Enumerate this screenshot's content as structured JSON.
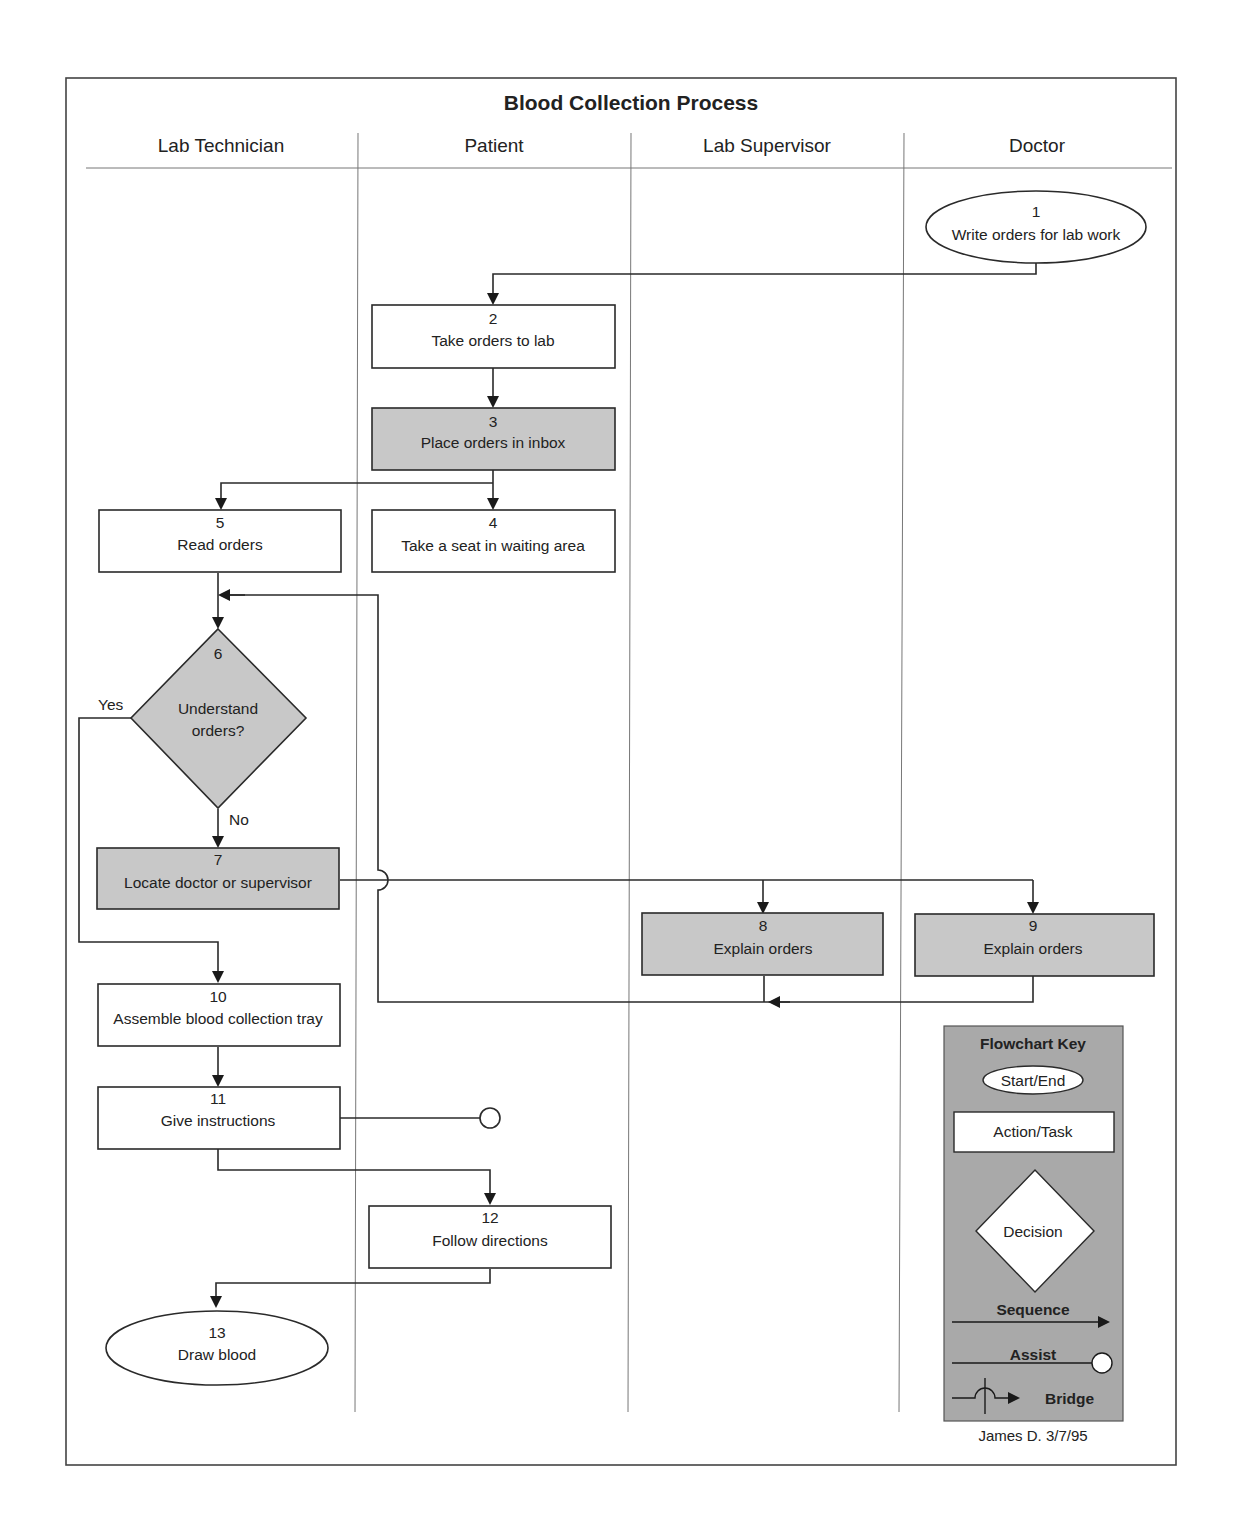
{
  "diagram": {
    "title": "Blood Collection Process",
    "lanes": [
      "Lab Technician",
      "Patient",
      "Lab Supervisor",
      "Doctor"
    ],
    "nodes": [
      {
        "id": "1",
        "label": "Write orders for lab work",
        "shape": "ellipse",
        "lane": "Doctor",
        "fill": "white"
      },
      {
        "id": "2",
        "label": "Take orders to lab",
        "shape": "rect",
        "lane": "Patient",
        "fill": "white"
      },
      {
        "id": "3",
        "label": "Place orders in inbox",
        "shape": "rect",
        "lane": "Patient",
        "fill": "gray"
      },
      {
        "id": "4",
        "label": "Take a seat in waiting area",
        "shape": "rect",
        "lane": "Patient",
        "fill": "white"
      },
      {
        "id": "5",
        "label": "Read orders",
        "shape": "rect",
        "lane": "Lab Technician",
        "fill": "white"
      },
      {
        "id": "6",
        "label": "Understand orders?",
        "label_lines": [
          "Understand",
          "orders?"
        ],
        "shape": "diamond",
        "lane": "Lab Technician",
        "fill": "gray"
      },
      {
        "id": "7",
        "label": "Locate doctor or supervisor",
        "shape": "rect",
        "lane": "Lab Technician",
        "fill": "gray"
      },
      {
        "id": "8",
        "label": "Explain orders",
        "shape": "rect",
        "lane": "Lab Supervisor",
        "fill": "gray"
      },
      {
        "id": "9",
        "label": "Explain orders",
        "shape": "rect",
        "lane": "Doctor",
        "fill": "gray"
      },
      {
        "id": "10",
        "label": "Assemble blood collection tray",
        "shape": "rect",
        "lane": "Lab Technician",
        "fill": "white"
      },
      {
        "id": "11",
        "label": "Give instructions",
        "shape": "rect",
        "lane": "Lab Technician",
        "fill": "white"
      },
      {
        "id": "12",
        "label": "Follow directions",
        "shape": "rect",
        "lane": "Patient",
        "fill": "white"
      },
      {
        "id": "13",
        "label": "Draw blood",
        "shape": "ellipse",
        "lane": "Lab Technician",
        "fill": "white"
      }
    ],
    "edges": [
      {
        "from": "1",
        "to": "2",
        "type": "sequence"
      },
      {
        "from": "2",
        "to": "3",
        "type": "sequence"
      },
      {
        "from": "3",
        "to": "4",
        "type": "sequence"
      },
      {
        "from": "3",
        "to": "5",
        "type": "sequence"
      },
      {
        "from": "5",
        "to": "6",
        "type": "sequence"
      },
      {
        "from": "6",
        "to": "7",
        "type": "sequence",
        "label": "No"
      },
      {
        "from": "6",
        "to": "10",
        "type": "sequence",
        "label": "Yes"
      },
      {
        "from": "7",
        "to": "8",
        "type": "sequence"
      },
      {
        "from": "7",
        "to": "9",
        "type": "sequence"
      },
      {
        "from": "8",
        "to": "6",
        "type": "sequence",
        "bridge": "the vertical return line hops over the horizontal line from 7"
      },
      {
        "from": "9",
        "to": "6",
        "type": "sequence"
      },
      {
        "from": "10",
        "to": "11",
        "type": "sequence"
      },
      {
        "from": "11",
        "to": "patient-lane",
        "type": "assist"
      },
      {
        "from": "11",
        "to": "12",
        "type": "sequence"
      },
      {
        "from": "12",
        "to": "13",
        "type": "sequence"
      }
    ],
    "branch_labels": {
      "yes": "Yes",
      "no": "No"
    },
    "key": {
      "title": "Flowchart Key",
      "start_end": "Start/End",
      "action_task": "Action/Task",
      "decision": "Decision",
      "sequence": "Sequence",
      "assist": "Assist",
      "bridge": "Bridge"
    },
    "signature": "James D. 3/7/95",
    "colors": {
      "gray_fill": "#c8c8c8",
      "key_fill": "#a9a9a9",
      "line": "#2a2a2a",
      "lane_line": "#777777"
    }
  }
}
